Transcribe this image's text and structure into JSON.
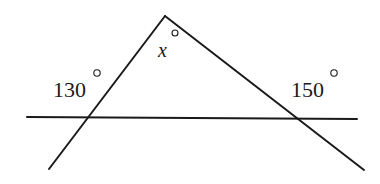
{
  "diagram": {
    "type": "geometry-angles",
    "points": {
      "apex": [
        165,
        16
      ],
      "left_end": [
        49,
        169
      ],
      "right_end": [
        364,
        170
      ],
      "transversal_start": [
        27,
        117
      ],
      "transversal_end": [
        357,
        119
      ],
      "left_intersection": [
        89,
        117
      ],
      "right_intersection": [
        300,
        119
      ]
    },
    "labels": {
      "apex_angle": {
        "variable": "x",
        "degree_symbol": "°",
        "text_pos": [
          158,
          57
        ],
        "degree_pos": [
          175,
          33
        ]
      },
      "left_angle": {
        "value": "130",
        "degree_symbol": "°",
        "text_pos": [
          53,
          97
        ],
        "degree_pos": [
          97,
          73
        ]
      },
      "right_angle": {
        "value": "150",
        "degree_symbol": "°",
        "text_pos": [
          291,
          97
        ],
        "degree_pos": [
          334,
          73
        ]
      }
    },
    "colors": {
      "stroke": "#1a1a1a",
      "background": "#ffffff"
    }
  }
}
